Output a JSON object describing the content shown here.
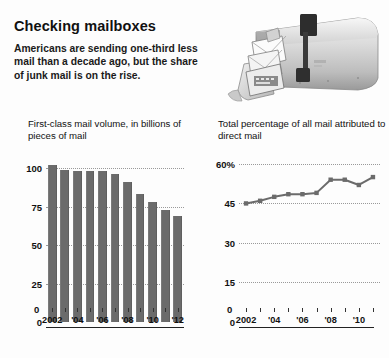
{
  "headline": "Checking mailboxes",
  "deck": "Americans are sending one-third less mail than a decade ago, but the share of junk mail is on the rise.",
  "photo": {
    "name": "open-mailbox-photo",
    "alt": "Open metal mailbox with letters spilling out and flag raised"
  },
  "colors": {
    "bar": "#6b6b6b",
    "line": "#6b6b6b",
    "grid": "#9a9a9a",
    "axis": "#222222",
    "text": "#111111",
    "background": "#fdfdfd"
  },
  "chart_data": [
    {
      "type": "bar",
      "name": "first-class-mail-volume",
      "title": "First-class mail volume, in billions of pieces of mail",
      "xlabel": "",
      "ylabel": "",
      "ylim": [
        0,
        108
      ],
      "yticks": [
        0,
        25,
        50,
        75,
        100
      ],
      "ytick_labels": [
        "0",
        "25",
        "50",
        "75",
        "100"
      ],
      "grid": true,
      "categories": [
        2002,
        2003,
        2004,
        2005,
        2006,
        2007,
        2008,
        2009,
        2010,
        2011,
        2012
      ],
      "xtick_labels": [
        "2002",
        "",
        "'04",
        "",
        "'06",
        "",
        "'08",
        "",
        "'10",
        "",
        "'12"
      ],
      "values": [
        102,
        99,
        98,
        98.5,
        98,
        96,
        91,
        83,
        78,
        73,
        69
      ]
    },
    {
      "type": "line",
      "name": "direct-mail-share",
      "title": "Total percentage of all mail attributed to direct mail",
      "xlabel": "",
      "ylabel": "",
      "ylim": [
        0,
        63
      ],
      "yticks": [
        0,
        15,
        30,
        45,
        60
      ],
      "ytick_labels": [
        "0",
        "15",
        "30",
        "45",
        "60%"
      ],
      "grid": true,
      "x": [
        2002,
        2003,
        2004,
        2005,
        2006,
        2007,
        2008,
        2009,
        2010,
        2011
      ],
      "xtick_labels": [
        "2002",
        "",
        "'04",
        "",
        "'06",
        "",
        "'08",
        "",
        "'10",
        ""
      ],
      "values": [
        45,
        46,
        47.5,
        48.5,
        48.5,
        49,
        54,
        54,
        52,
        55
      ],
      "markers": true
    }
  ]
}
